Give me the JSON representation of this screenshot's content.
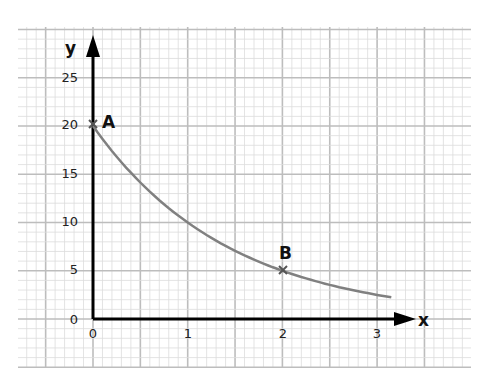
{
  "chart_data": {
    "type": "line",
    "title": "",
    "xlabel": "x",
    "ylabel": "y",
    "xlim": [
      -0.8,
      3.98
    ],
    "ylim": [
      -5,
      30
    ],
    "grid": true,
    "x_ticks": [
      "0",
      "1",
      "2",
      "3"
    ],
    "y_ticks": [
      "0",
      "5",
      "10",
      "15",
      "20",
      "25"
    ],
    "series": [
      {
        "name": "y = 20 × 0.5^x",
        "x": [
          0,
          0.5,
          1,
          1.5,
          2,
          2.5,
          3,
          3.15
        ],
        "values": [
          20,
          14.1,
          10,
          7.1,
          5,
          3.5,
          2.5,
          2.25
        ]
      }
    ],
    "annotations": [
      {
        "label": "A",
        "x": 0,
        "y": 20,
        "marker": "cross"
      },
      {
        "label": "B",
        "x": 2,
        "y": 5,
        "marker": "cross"
      }
    ]
  },
  "labels": {
    "x_axis": "x",
    "y_axis": "y",
    "point_a": "A",
    "point_b": "B",
    "yticks": [
      "25",
      "20",
      "15",
      "10",
      "5",
      "0"
    ],
    "xticks": [
      "0",
      "1",
      "2",
      "3"
    ]
  },
  "colors": {
    "grid_minor": "#dcdcdc",
    "grid_major": "#bdbdbd",
    "axis": "#000000",
    "curve": "#808080"
  }
}
